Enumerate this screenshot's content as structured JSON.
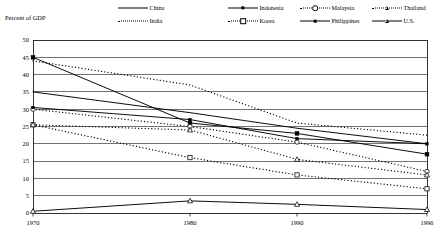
{
  "axis_title": "Percent of GDP",
  "legend": [
    {
      "name": "China",
      "style": "solid",
      "marker": "none"
    },
    {
      "name": "India",
      "style": "dotted",
      "marker": "none"
    },
    {
      "name": "Indonesia",
      "style": "solid",
      "marker": "square-filled"
    },
    {
      "name": "Korea",
      "style": "dotted",
      "marker": "square-open"
    },
    {
      "name": "Malaysia",
      "style": "dotted",
      "marker": "circle-open"
    },
    {
      "name": "Philippines",
      "style": "solid",
      "marker": "square-small-filled"
    },
    {
      "name": "Thailand",
      "style": "dotted",
      "marker": "triangle-open"
    },
    {
      "name": "U.S.",
      "style": "solid",
      "marker": "triangle-open"
    }
  ],
  "chart_data": {
    "type": "line",
    "title": "",
    "xlabel": "",
    "ylabel": "Percent of GDP",
    "x": [
      1970,
      1980,
      1990,
      1996
    ],
    "xtick_labels": [
      "1970",
      "1980",
      "1990",
      "1996"
    ],
    "ytick_labels": [
      "0",
      "5",
      "10",
      "15",
      "20",
      "25",
      "30",
      "35",
      "40",
      "45",
      "50"
    ],
    "yticks": [
      0,
      5,
      10,
      15,
      20,
      25,
      30,
      35,
      40,
      45,
      50
    ],
    "ylim": [
      0,
      50
    ],
    "xlim": [
      1970,
      1996
    ],
    "grid": "horizontal",
    "legend_position": "top",
    "series": [
      {
        "name": "China",
        "style": "solid",
        "marker": "none",
        "color": "#000000",
        "values": [
          35.0,
          29.0,
          24.5,
          20.0
        ]
      },
      {
        "name": "India",
        "style": "dotted",
        "marker": "none",
        "color": "#000000",
        "values": [
          44.0,
          37.0,
          26.0,
          22.5
        ]
      },
      {
        "name": "Indonesia",
        "style": "solid",
        "marker": "square-filled",
        "color": "#000000",
        "values": [
          45.0,
          26.0,
          23.0,
          17.0
        ]
      },
      {
        "name": "Korea",
        "style": "dotted",
        "marker": "square-open",
        "color": "#000000",
        "values": [
          25.5,
          16.0,
          11.0,
          7.0
        ]
      },
      {
        "name": "Malaysia",
        "style": "dotted",
        "marker": "circle-open",
        "color": "#000000",
        "values": [
          30.0,
          25.0,
          20.5,
          12.0
        ]
      },
      {
        "name": "Philippines",
        "style": "solid",
        "marker": "square-small-filled",
        "color": "#000000",
        "values": [
          30.5,
          27.0,
          21.5,
          20.0
        ]
      },
      {
        "name": "Thailand",
        "style": "dotted",
        "marker": "triangle-open",
        "color": "#000000",
        "values": [
          25.5,
          24.0,
          15.5,
          11.0
        ]
      },
      {
        "name": "U.S.",
        "style": "solid",
        "marker": "triangle-open",
        "color": "#000000",
        "values": [
          0.5,
          3.5,
          2.5,
          1.0
        ]
      }
    ]
  }
}
